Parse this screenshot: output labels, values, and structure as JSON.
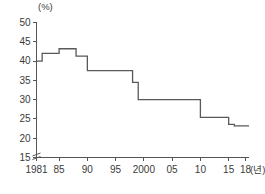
{
  "chart_data": {
    "type": "line",
    "line_style": "step-post",
    "title": "",
    "subtitle": "",
    "xlabel": "年",
    "ylabel": "%",
    "y_unit_label": "(%)",
    "x_unit_label": "(년)",
    "grid": false,
    "legend": null,
    "axis_break": true,
    "axis_break_note": "y-axis broken below 15",
    "ylim": [
      15,
      50
    ],
    "xlim": [
      1981,
      2018.6
    ],
    "yticks": [
      15,
      20,
      25,
      30,
      35,
      40,
      45,
      50
    ],
    "ytick_labels": [
      "15",
      "20",
      "25",
      "30",
      "35",
      "40",
      "45",
      "50"
    ],
    "xticks": [
      1981,
      1985,
      1990,
      1995,
      2000,
      2005,
      2010,
      2015,
      2018
    ],
    "xtick_labels": [
      "1981",
      "85",
      "90",
      "95",
      "2000",
      "05",
      "10",
      "15",
      "18"
    ],
    "x": [
      1981,
      1982,
      1983,
      1984,
      1985,
      1986,
      1987,
      1988,
      1989,
      1990,
      1991,
      1992,
      1993,
      1994,
      1995,
      1996,
      1997,
      1998,
      1999,
      2000,
      2001,
      2002,
      2003,
      2004,
      2005,
      2006,
      2007,
      2008,
      2009,
      2010,
      2011,
      2012,
      2013,
      2014,
      2015,
      2016,
      2017,
      2018
    ],
    "values": [
      40.0,
      42.0,
      42.0,
      42.0,
      43.2,
      43.2,
      43.2,
      41.3,
      41.3,
      37.5,
      37.5,
      37.5,
      37.5,
      37.5,
      37.5,
      37.5,
      37.5,
      34.5,
      30.0,
      30.0,
      30.0,
      30.0,
      30.0,
      30.0,
      30.0,
      30.0,
      30.0,
      30.0,
      30.0,
      25.4,
      25.4,
      25.4,
      25.4,
      25.4,
      23.6,
      23.2,
      23.2,
      23.2
    ],
    "series": [
      {
        "name": "series-1",
        "color": "#595959",
        "values": [
          40.0,
          42.0,
          42.0,
          42.0,
          43.2,
          43.2,
          43.2,
          41.3,
          41.3,
          37.5,
          37.5,
          37.5,
          37.5,
          37.5,
          37.5,
          37.5,
          37.5,
          34.5,
          30.0,
          30.0,
          30.0,
          30.0,
          30.0,
          30.0,
          30.0,
          30.0,
          30.0,
          30.0,
          30.0,
          25.4,
          25.4,
          25.4,
          25.4,
          25.4,
          23.6,
          23.2,
          23.2,
          23.2
        ]
      }
    ],
    "annotations": []
  },
  "colors": {
    "line": "#595959",
    "axis": "#555555",
    "text": "#3a3a3a",
    "background": "#ffffff"
  }
}
